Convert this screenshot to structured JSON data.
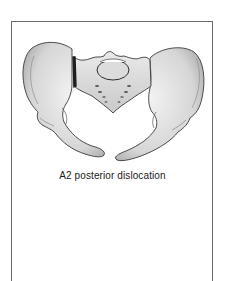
{
  "figure": {
    "caption": "A2 posterior dislocation",
    "highlight": "sacroiliac-joint-disruption-left",
    "colors": {
      "frame": "#6b6b6b",
      "bone_fill": "#e4e4e4",
      "bone_shade": "#b8b8b8",
      "outline": "#3a3a3a",
      "joint_line": "#222222",
      "background": "#ffffff"
    }
  }
}
